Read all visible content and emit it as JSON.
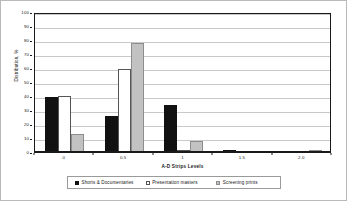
{
  "chart_data": {
    "type": "bar",
    "title": "",
    "xlabel": "A-D Strips Levels",
    "ylabel": "Distribution, %",
    "categories": [
      "0",
      "0.5",
      "1",
      "1.5",
      "2.0"
    ],
    "xtick_labels": [
      "0",
      "0.5",
      "1",
      "1.5",
      "2.0"
    ],
    "ytick_labels": [
      "0",
      "10",
      "20",
      "30",
      "40",
      "50",
      "60",
      "70",
      "80",
      "90",
      "100"
    ],
    "ylim": [
      0,
      100
    ],
    "grid": true,
    "legend_position": "bottom",
    "series": [
      {
        "name": "Shorts & Documentaries",
        "color": "#111111",
        "values": [
          39,
          25.5,
          33.5,
          0.8,
          0
        ]
      },
      {
        "name": "Presentation masters",
        "color": "#ffffff",
        "values": [
          40,
          59,
          1,
          0,
          0
        ]
      },
      {
        "name": "Screening prints",
        "color": "#c2c2c2",
        "values": [
          13,
          78,
          8,
          0,
          0.7
        ]
      }
    ]
  },
  "legend": {
    "items": [
      {
        "label": "Shorts & Documentaries"
      },
      {
        "label": "Presentation masters"
      },
      {
        "label": "Screening prints"
      }
    ]
  }
}
